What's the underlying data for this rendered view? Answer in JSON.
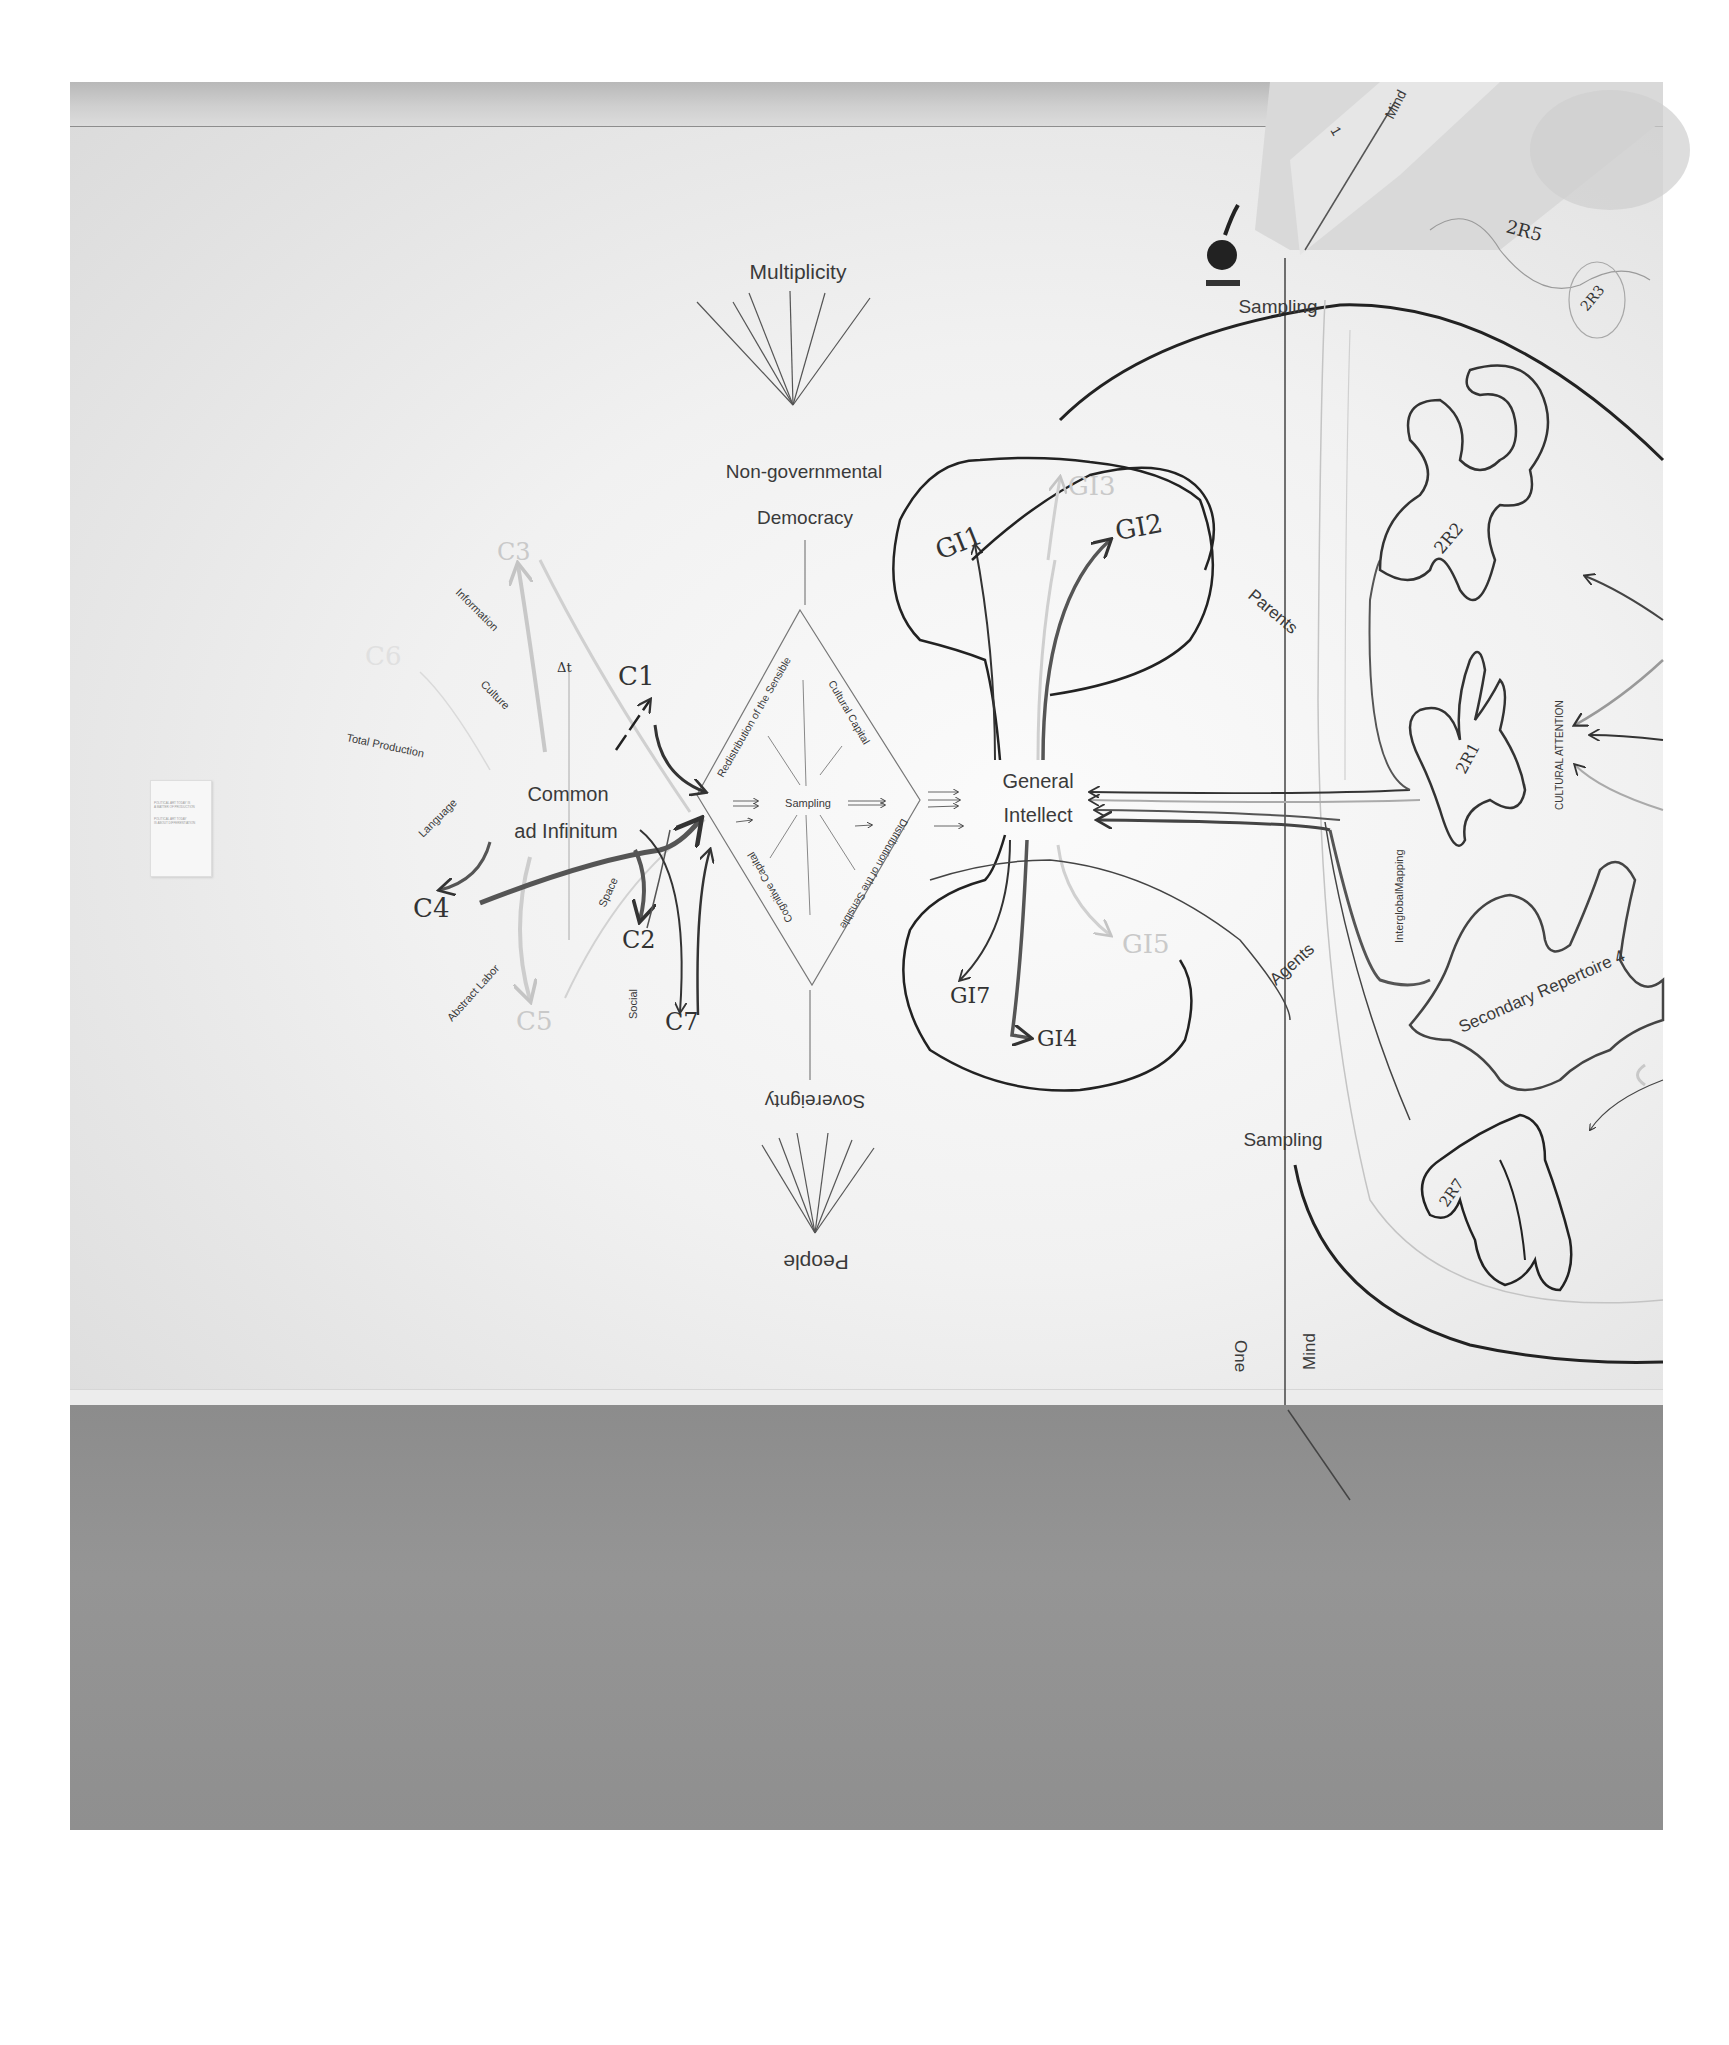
{
  "artwork": {
    "type": "wall drawing installation photograph",
    "colors": {
      "wall": "#f4f4f4",
      "floor": "#909090",
      "ink_dark": "#2a2a2a",
      "ink_mid": "#6a6a6a",
      "ink_faint": "#c8c8c8"
    }
  },
  "placard": {
    "line1": "POLITICAL ART TODAY IS",
    "line2": "A MATTER OF PRODUCTION",
    "line3": "POLITICAL ART TODAY",
    "line4": "IS ABOUT DIFFERENTIATION"
  },
  "axis_top": {
    "label": "Multiplicity"
  },
  "axis_upper": {
    "line1": "Non-governmental",
    "line2": "Democracy"
  },
  "axis_lower": {
    "label": "Sovereignty",
    "rotated": "180deg"
  },
  "axis_bottom": {
    "label": "People",
    "rotated": "180deg"
  },
  "common": {
    "title_line1": "Common",
    "title_line2": "ad Infinitum",
    "delta": "Δt",
    "nodes": [
      "C1",
      "C2",
      "C3",
      "C4",
      "C5",
      "C6",
      "C7"
    ],
    "faint_nodes": [
      "C3",
      "C5",
      "C6"
    ],
    "spokes": [
      "Information",
      "Culture",
      "Total Production",
      "Language",
      "Abstract Labor",
      "Space",
      "Social"
    ]
  },
  "diamond": {
    "center": "Sampling",
    "edges": [
      "Redistribution of the Sensible",
      "Cultural Capital",
      "Distribution of the Sensible",
      "Cognitive Capital"
    ]
  },
  "general_intellect": {
    "title_line1": "General",
    "title_line2": "Intellect",
    "nodes": [
      "GI1",
      "GI2",
      "GI3",
      "GI4",
      "GI5",
      "GI7"
    ],
    "faint_nodes": [
      "GI3",
      "GI5",
      "GI6"
    ]
  },
  "mind": {
    "sampling_top": "Sampling",
    "sampling_bottom": "Sampling",
    "parents": "Parents",
    "agents": "Agents",
    "interglobal": "InterglobalMapping",
    "cultural_attention": "CULTURAL   ATTENTION",
    "secondary_repertoire": "Secondary Repertoire 4",
    "repertoires": [
      "2R1",
      "2R2",
      "2R3",
      "2R5",
      "2R7"
    ],
    "axis_left": "One",
    "axis_right": "Mind",
    "ceiling_panel_number": "1",
    "ceiling_panel_label": "Mind"
  }
}
